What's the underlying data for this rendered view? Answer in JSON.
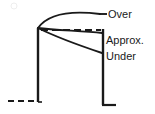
{
  "diagram": {
    "type": "line-diagram",
    "canvas": {
      "width": 155,
      "height": 114
    },
    "colors": {
      "stroke": "#1a1a1a",
      "background": "#ffffff"
    },
    "labels": {
      "over": "Over",
      "approx": "Approx.",
      "under": "Under"
    },
    "elements": {
      "left_axis_name": "left-vertical-line",
      "right_axis_name": "right-vertical-line",
      "baseline_name": "dashed-baseline",
      "apex_name": "curve-apex-point"
    },
    "geometry": {
      "apex": [
        38,
        28
      ],
      "left_vertical": {
        "x": 38,
        "y1": 28,
        "y2": 102
      },
      "right_vertical": {
        "x": 103,
        "y1": 29,
        "y2": 105
      },
      "right_foot": {
        "x1": 103,
        "x2": 115,
        "y": 105
      },
      "left_foot_dashes": {
        "x1": 8,
        "x2": 38,
        "y": 101
      },
      "over_curve": {
        "start": [
          38,
          28
        ],
        "end": [
          103,
          14
        ]
      },
      "approx_dashed": {
        "start": [
          40,
          30
        ],
        "end": [
          101,
          30
        ]
      },
      "approx_curve": {
        "start": [
          38,
          28
        ],
        "end": [
          103,
          33
        ]
      },
      "under_curve": {
        "start": [
          38,
          28
        ],
        "end": [
          103,
          53
        ]
      },
      "leader_over": {
        "x1": 100,
        "x2": 107,
        "y": 14
      }
    }
  }
}
